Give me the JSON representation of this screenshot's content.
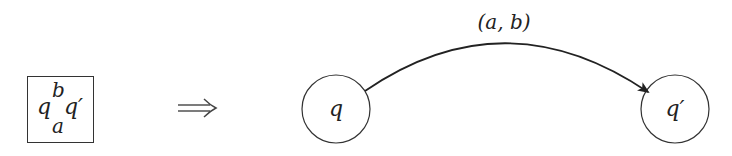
{
  "diagram": {
    "rule_box": {
      "from_state": "q",
      "top_symbol": "b",
      "bottom_symbol": "a",
      "to_state": "q′"
    },
    "implies_symbol": "⟹",
    "automaton": {
      "states": [
        {
          "id": "q",
          "label": "q",
          "cx": 336,
          "cy": 109,
          "r": 34
        },
        {
          "id": "q_prime",
          "label": "q′",
          "cx": 675,
          "cy": 109,
          "r": 34
        }
      ],
      "transition": {
        "from": "q",
        "to": "q_prime",
        "label": "(a, b)"
      }
    },
    "colors": {
      "stroke": "#333333",
      "text": "#222222",
      "background": "#ffffff"
    }
  }
}
